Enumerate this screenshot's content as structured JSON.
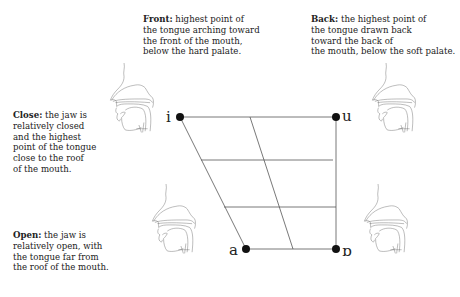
{
  "notes": {
    "front": {
      "term": "Front:",
      "text": " highest point of\nthe tongue arching toward\nthe front of the mouth,\nbelow the hard palate."
    },
    "back": {
      "term": "Back:",
      "text": " the highest point of\nthe tongue drawn back\ntoward the back of\nthe mouth, below the soft palate."
    },
    "close": {
      "term": "Close:",
      "text": " the jaw is\nrelatively closed\nand the highest\npoint of the tongue\nclose to the roof\nof the mouth."
    },
    "open": {
      "term": "Open:",
      "text": " the jaw is\nrelatively open, with\nthe tongue far from\nthe roof of the mouth."
    }
  },
  "vowels": {
    "close_front": "i",
    "close_back": "u",
    "open_front": "a",
    "open_back": "ɒ"
  },
  "illustrations": [
    {
      "name": "head-close-front",
      "position": "left-top"
    },
    {
      "name": "head-close-back",
      "position": "right-top"
    },
    {
      "name": "head-open-front",
      "position": "left-bottom"
    },
    {
      "name": "head-open-back",
      "position": "right-bottom"
    }
  ]
}
